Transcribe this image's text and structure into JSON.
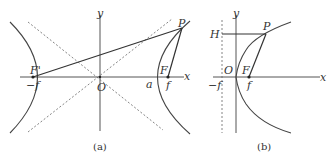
{
  "figure_a": {
    "caption": "(a)",
    "labels": {
      "y": "y",
      "x": "x",
      "O": "O",
      "P": "P",
      "F": "F",
      "F_prime": "F'",
      "a": "a",
      "f": "f",
      "minus_f": "−f"
    }
  },
  "figure_b": {
    "caption": "(b)",
    "labels": {
      "y": "y",
      "x": "x",
      "O": "O",
      "P": "P",
      "F": "F",
      "H": "H",
      "f": "f",
      "minus_f": "−f"
    }
  }
}
